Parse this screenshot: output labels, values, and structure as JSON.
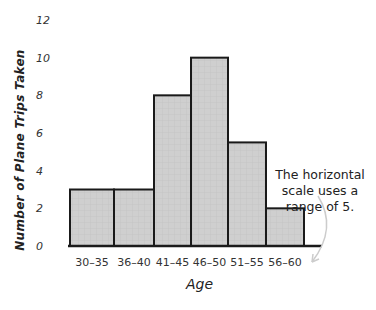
{
  "chart_data": {
    "type": "bar",
    "subtype": "histogram",
    "title": "",
    "xlabel": "Age",
    "ylabel": "Number of Plane Trips Taken",
    "categories": [
      "30–35",
      "36–40",
      "41–45",
      "46–50",
      "51–55",
      "56–60"
    ],
    "values": [
      3,
      3,
      8,
      10,
      5.5,
      2
    ],
    "yticks": [
      "0",
      "2",
      "4",
      "6",
      "8",
      "10",
      "12"
    ],
    "ylim": [
      0,
      12
    ],
    "grid": false,
    "legend": null,
    "annotation": "The horizontal scale uses a range of 5.",
    "colors": {
      "bar_fill": "#cfcfcf",
      "bar_stroke": "#1a1a1a",
      "arrow": "#c8c8c8"
    }
  },
  "annotation_lines": [
    "The horizontal",
    "scale uses a",
    "range of 5."
  ]
}
